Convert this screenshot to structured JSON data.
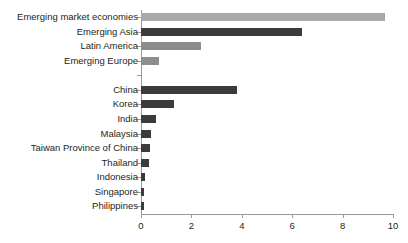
{
  "top_clip_text": "",
  "chart_data": {
    "type": "bar",
    "orientation": "horizontal",
    "title": "",
    "xlabel": "",
    "ylabel": "",
    "xlim": [
      0,
      10
    ],
    "xticks": [
      0,
      2,
      4,
      6,
      8,
      10
    ],
    "xtick_labels": [
      "0",
      "2",
      "4",
      "6",
      "8",
      "10"
    ],
    "grid": false,
    "legend": "none",
    "categories": [
      "Emerging market economies",
      "Emerging Asia",
      "Latin America",
      "Emerging Europe",
      "",
      "China",
      "Korea",
      "India",
      "Malaysia",
      "Taiwan Province of China",
      "Thailand",
      "Indonesia",
      "Singapore",
      "Philippines"
    ],
    "values": [
      9.7,
      6.4,
      2.4,
      0.7,
      null,
      3.8,
      1.3,
      0.6,
      0.4,
      0.35,
      0.3,
      0.14,
      0.12,
      0.1
    ],
    "colors": [
      "#a8a8a8",
      "#3b3b3b",
      "#8d8d8d",
      "#8d8d8d",
      "#00000000",
      "#3b3b3b",
      "#3b3b3b",
      "#3b3b3b",
      "#3b3b3b",
      "#3b3b3b",
      "#3b3b3b",
      "#3b3b3b",
      "#3b3b3b",
      "#3b3b3b"
    ],
    "axis_color": "#9a9a9a",
    "text_color": "#231f20"
  }
}
